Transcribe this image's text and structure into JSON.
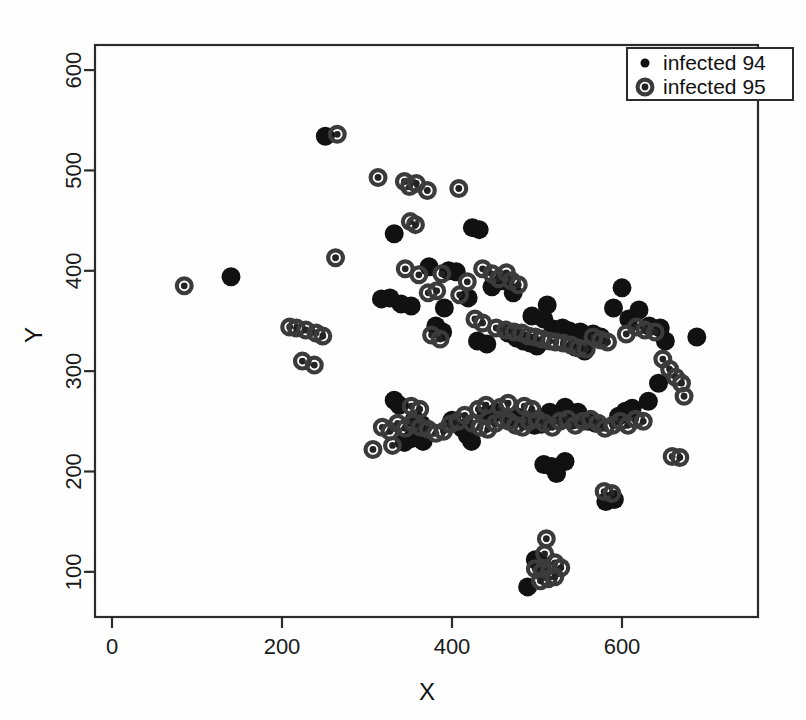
{
  "chart_data": {
    "type": "scatter",
    "title": "",
    "xlabel": "X",
    "ylabel": "Y",
    "xlim": [
      -20,
      760
    ],
    "ylim": [
      55,
      625
    ],
    "xticks": [
      0,
      200,
      400,
      600
    ],
    "yticks": [
      100,
      200,
      300,
      400,
      500,
      600
    ],
    "xtick_labels": [
      "0",
      "200",
      "400",
      "600"
    ],
    "ytick_labels": [
      "100",
      "200",
      "300",
      "400",
      "500",
      "600"
    ],
    "grid": false,
    "legend_position": "top-right",
    "legend": [
      {
        "name": "infected 94",
        "marker": "filled-circle",
        "size": "small",
        "color": "#111111"
      },
      {
        "name": "infected 95",
        "marker": "ringed-circle",
        "size": "large",
        "color": "#3b3b3b"
      }
    ],
    "series": [
      {
        "name": "infected 94",
        "marker": "filled-circle",
        "points": [
          [
            140,
            394
          ],
          [
            251,
            534
          ],
          [
            332,
            437
          ],
          [
            317,
            372
          ],
          [
            327,
            373
          ],
          [
            340,
            367
          ],
          [
            352,
            365
          ],
          [
            391,
            363
          ],
          [
            396,
            400
          ],
          [
            424,
            443
          ],
          [
            432,
            441
          ],
          [
            405,
            399
          ],
          [
            419,
            373
          ],
          [
            447,
            384
          ],
          [
            460,
            390
          ],
          [
            472,
            378
          ],
          [
            494,
            355
          ],
          [
            508,
            352
          ],
          [
            512,
            366
          ],
          [
            519,
            342
          ],
          [
            530,
            343
          ],
          [
            538,
            340
          ],
          [
            551,
            339
          ],
          [
            566,
            337
          ],
          [
            575,
            334
          ],
          [
            590,
            363
          ],
          [
            600,
            383
          ],
          [
            608,
            352
          ],
          [
            620,
            361
          ],
          [
            632,
            345
          ],
          [
            645,
            343
          ],
          [
            651,
            330
          ],
          [
            688,
            334
          ],
          [
            332,
            271
          ],
          [
            338,
            266
          ],
          [
            356,
            252
          ],
          [
            364,
            247
          ],
          [
            400,
            251
          ],
          [
            412,
            243
          ],
          [
            418,
            236
          ],
          [
            423,
            230
          ],
          [
            440,
            256
          ],
          [
            452,
            259
          ],
          [
            468,
            252
          ],
          [
            478,
            254
          ],
          [
            489,
            250
          ],
          [
            497,
            246
          ],
          [
            505,
            247
          ],
          [
            515,
            259
          ],
          [
            524,
            256
          ],
          [
            533,
            264
          ],
          [
            540,
            251
          ],
          [
            548,
            259
          ],
          [
            560,
            250
          ],
          [
            569,
            248
          ],
          [
            596,
            255
          ],
          [
            604,
            260
          ],
          [
            612,
            263
          ],
          [
            631,
            270
          ],
          [
            643,
            288
          ],
          [
            508,
            207
          ],
          [
            517,
            205
          ],
          [
            523,
            198
          ],
          [
            533,
            210
          ],
          [
            489,
            85
          ],
          [
            498,
            112
          ],
          [
            506,
            107
          ],
          [
            381,
            345
          ],
          [
            389,
            339
          ],
          [
            466,
            338
          ],
          [
            476,
            333
          ],
          [
            484,
            330
          ],
          [
            492,
            328
          ],
          [
            500,
            325
          ],
          [
            545,
            324
          ],
          [
            556,
            320
          ],
          [
            430,
            330
          ],
          [
            441,
            327
          ],
          [
            353,
            233
          ],
          [
            344,
            229
          ],
          [
            581,
            170
          ],
          [
            591,
            172
          ],
          [
            373,
            404
          ],
          [
            366,
            230
          ]
        ]
      },
      {
        "name": "infected 95",
        "marker": "ringed-circle",
        "points": [
          [
            85,
            385
          ],
          [
            265,
            536
          ],
          [
            263,
            413
          ],
          [
            209,
            344
          ],
          [
            217,
            343
          ],
          [
            228,
            341
          ],
          [
            240,
            338
          ],
          [
            248,
            335
          ],
          [
            224,
            310
          ],
          [
            238,
            306
          ],
          [
            313,
            493
          ],
          [
            344,
            489
          ],
          [
            350,
            484
          ],
          [
            358,
            487
          ],
          [
            371,
            480
          ],
          [
            408,
            482
          ],
          [
            351,
            449
          ],
          [
            357,
            446
          ],
          [
            345,
            402
          ],
          [
            361,
            396
          ],
          [
            388,
            397
          ],
          [
            372,
            378
          ],
          [
            382,
            380
          ],
          [
            409,
            376
          ],
          [
            418,
            389
          ],
          [
            436,
            402
          ],
          [
            447,
            397
          ],
          [
            455,
            392
          ],
          [
            464,
            398
          ],
          [
            470,
            390
          ],
          [
            478,
            386
          ],
          [
            427,
            352
          ],
          [
            436,
            348
          ],
          [
            452,
            343
          ],
          [
            463,
            341
          ],
          [
            473,
            339
          ],
          [
            482,
            338
          ],
          [
            490,
            335
          ],
          [
            498,
            334
          ],
          [
            506,
            332
          ],
          [
            515,
            330
          ],
          [
            522,
            329
          ],
          [
            531,
            328
          ],
          [
            540,
            326
          ],
          [
            549,
            323
          ],
          [
            558,
            322
          ],
          [
            566,
            334
          ],
          [
            575,
            331
          ],
          [
            583,
            329
          ],
          [
            605,
            337
          ],
          [
            617,
            344
          ],
          [
            627,
            341
          ],
          [
            639,
            339
          ],
          [
            648,
            312
          ],
          [
            656,
            302
          ],
          [
            663,
            294
          ],
          [
            670,
            288
          ],
          [
            673,
            275
          ],
          [
            659,
            215
          ],
          [
            668,
            214
          ],
          [
            307,
            222
          ],
          [
            318,
            244
          ],
          [
            327,
            240
          ],
          [
            336,
            248
          ],
          [
            330,
            226
          ],
          [
            345,
            243
          ],
          [
            354,
            248
          ],
          [
            363,
            244
          ],
          [
            372,
            242
          ],
          [
            381,
            238
          ],
          [
            390,
            240
          ],
          [
            398,
            247
          ],
          [
            407,
            250
          ],
          [
            415,
            256
          ],
          [
            424,
            248
          ],
          [
            433,
            244
          ],
          [
            442,
            242
          ],
          [
            451,
            248
          ],
          [
            459,
            252
          ],
          [
            467,
            250
          ],
          [
            475,
            246
          ],
          [
            483,
            244
          ],
          [
            491,
            250
          ],
          [
            500,
            252
          ],
          [
            509,
            248
          ],
          [
            518,
            244
          ],
          [
            527,
            250
          ],
          [
            536,
            252
          ],
          [
            545,
            246
          ],
          [
            554,
            250
          ],
          [
            563,
            252
          ],
          [
            572,
            248
          ],
          [
            580,
            243
          ],
          [
            589,
            246
          ],
          [
            598,
            250
          ],
          [
            607,
            246
          ],
          [
            616,
            252
          ],
          [
            625,
            250
          ],
          [
            511,
            133
          ],
          [
            509,
            118
          ],
          [
            498,
            103
          ],
          [
            506,
            100
          ],
          [
            515,
            101
          ],
          [
            521,
            109
          ],
          [
            528,
            104
          ],
          [
            513,
            93
          ],
          [
            521,
            95
          ],
          [
            504,
            91
          ],
          [
            579,
            180
          ],
          [
            588,
            178
          ],
          [
            352,
            265
          ],
          [
            362,
            262
          ],
          [
            431,
            262
          ],
          [
            440,
            266
          ],
          [
            457,
            264
          ],
          [
            466,
            268
          ],
          [
            485,
            265
          ],
          [
            494,
            262
          ],
          [
            376,
            336
          ],
          [
            386,
            332
          ]
        ]
      }
    ]
  }
}
